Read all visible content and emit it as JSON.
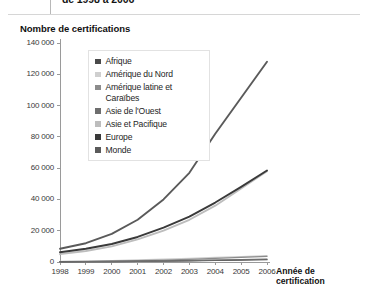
{
  "page": {
    "cut_off_heading": "de 1998 à 2006",
    "chart_title": "Nombre de certifications"
  },
  "chart_data": {
    "type": "line",
    "title": "Nombre de certifications",
    "xlabel": "Année de certification",
    "ylabel": "Nombre de certifications",
    "x": [
      "1998",
      "1999",
      "2000",
      "2001",
      "2002",
      "2003",
      "2004",
      "2005",
      "2006"
    ],
    "xtick_labels": [
      "1998",
      "1999",
      "2000",
      "2001",
      "2002",
      "2003",
      "2004",
      "2005",
      "2006"
    ],
    "ytick_labels": [
      "0",
      "20 000",
      "40 000",
      "60 000",
      "80 000",
      "100 000",
      "120 000",
      "140 000"
    ],
    "ytick_values": [
      0,
      20000,
      40000,
      60000,
      80000,
      100000,
      120000,
      140000
    ],
    "ylim": [
      0,
      140000
    ],
    "grid": false,
    "legend_position": "upper-left-inside",
    "series": [
      {
        "name": "Afrique",
        "color": "#4a4a4a",
        "values": [
          150,
          200,
          320,
          450,
          600,
          800,
          1000,
          1200,
          1500
        ]
      },
      {
        "name": "Amérique du Nord",
        "color": "#cfcfcf",
        "values": [
          400,
          600,
          900,
          1300,
          1800,
          2300,
          2900,
          3400,
          4000
        ]
      },
      {
        "name": "Amérique latine et Caraïbes",
        "color": "#8c8c8c",
        "values": [
          200,
          350,
          550,
          800,
          1200,
          1700,
          2300,
          2900,
          3600
        ]
      },
      {
        "name": "Asie de l'Ouest",
        "color": "#6e6e6e",
        "values": [
          100,
          150,
          250,
          400,
          600,
          850,
          1150,
          1500,
          1900
        ]
      },
      {
        "name": "Asie et Pacifique",
        "color": "#bdbdbd",
        "values": [
          5000,
          7000,
          10000,
          14500,
          20000,
          27000,
          36000,
          47000,
          58000
        ]
      },
      {
        "name": "Europe",
        "color": "#3a3a3a",
        "values": [
          6200,
          8500,
          11500,
          16000,
          22000,
          29000,
          38000,
          48000,
          58500
        ]
      },
      {
        "name": "Monde",
        "color": "#5a5a5a",
        "values": [
          8500,
          12000,
          18000,
          27000,
          40000,
          57000,
          82000,
          105000,
          128000
        ]
      }
    ]
  },
  "legend": {
    "items": [
      {
        "label": "Afrique",
        "color": "#4a4a4a"
      },
      {
        "label": "Amérique du Nord",
        "color": "#cfcfcf"
      },
      {
        "label": "Amérique latine et Caraïbes",
        "color": "#8c8c8c"
      },
      {
        "label": "Asie de l'Ouest",
        "color": "#6e6e6e"
      },
      {
        "label": "Asie et Pacifique",
        "color": "#bdbdbd"
      },
      {
        "label": "Europe",
        "color": "#3a3a3a"
      },
      {
        "label": "Monde",
        "color": "#5a5a5a"
      }
    ]
  },
  "axes": {
    "x_axis_title_line1": "Année de",
    "x_axis_title_line2": "certification"
  }
}
